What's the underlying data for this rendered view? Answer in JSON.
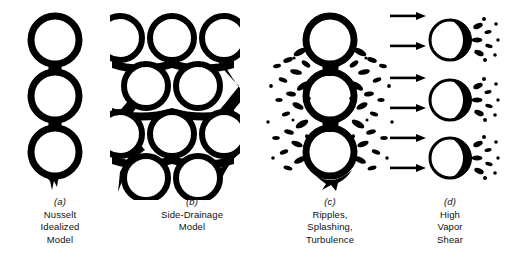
{
  "figure": {
    "background_color": "#ffffff",
    "ink_color": "#000000",
    "panel_count": 4
  },
  "panels": [
    {
      "id": "a",
      "tag": "(a)",
      "caption_lines": [
        "Nusselt",
        "Idealized",
        "Model"
      ],
      "caption_text": "Nusselt Idealized Model",
      "art": "three-stacked-tubes-with-smooth-condensate-film-and-pendant-drip",
      "tube_count": 3,
      "tube_rows": 3,
      "tube_columns": 1,
      "tube_diameter": 50,
      "tube_centers": [
        [
          55,
          40
        ],
        [
          55,
          96
        ],
        [
          55,
          152
        ]
      ],
      "film_thickness": 7,
      "has_arrows": false,
      "has_splash": false,
      "has_drip": true
    },
    {
      "id": "b",
      "tag": "(b)",
      "caption_lines": [
        "Side-Drainage",
        "Model"
      ],
      "caption_text": "Side-Drainage Model",
      "art": "staggered-tube-bundle-with-side-draining-condensate-columns",
      "tube_count": 10,
      "tube_rows": 4,
      "tube_diameter": 46,
      "tube_centers": [
        [
          120,
          38
        ],
        [
          170,
          38
        ],
        [
          220,
          38
        ],
        [
          145,
          86
        ],
        [
          195,
          86
        ],
        [
          120,
          134
        ],
        [
          170,
          134
        ],
        [
          220,
          134
        ],
        [
          145,
          178
        ],
        [
          195,
          178
        ]
      ],
      "film_thickness": 6,
      "has_arrows": false,
      "has_splash": false,
      "has_drip": true,
      "clipped_left_edge": true
    },
    {
      "id": "c",
      "tag": "(c)",
      "caption_lines": [
        "Ripples,",
        "Splashing,",
        "Turbulence"
      ],
      "caption_text": "Ripples, Splashing, Turbulence",
      "art": "three-stacked-tubes-with-irregular-splashing-droplets-radiating-outward",
      "tube_count": 3,
      "tube_rows": 3,
      "tube_columns": 1,
      "tube_diameter": 50,
      "tube_centers": [
        [
          330,
          40
        ],
        [
          330,
          96
        ],
        [
          330,
          152
        ]
      ],
      "film_thickness": 7,
      "has_arrows": false,
      "has_splash": true,
      "splash_blob_count": 74,
      "has_drip": true
    },
    {
      "id": "d",
      "tag": "(d)",
      "caption_lines": [
        "High",
        "Vapor",
        "Shear"
      ],
      "caption_text": "High Vapor Shear",
      "art": "three-tubes-with-horizontal-vapor-arrows-and-condensate-swept-downstream",
      "tube_count": 3,
      "tube_rows": 3,
      "tube_columns": 1,
      "tube_diameter": 44,
      "tube_centers": [
        [
          452,
          40
        ],
        [
          452,
          100
        ],
        [
          452,
          158
        ]
      ],
      "film_thickness": 6,
      "has_arrows": true,
      "arrow_count": 6,
      "arrow_direction": "right",
      "arrow_y_positions": [
        16,
        46,
        78,
        108,
        138,
        168
      ],
      "arrow_x_start": 390,
      "arrow_x_end": 424,
      "has_splash": true,
      "splash_blob_count": 46,
      "splash_side": "downstream-right",
      "has_drip": false
    }
  ]
}
